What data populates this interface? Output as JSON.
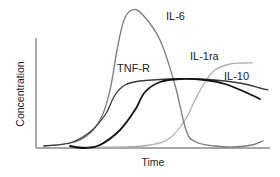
{
  "chart_data": {
    "type": "line",
    "title": "",
    "xlabel": "Time",
    "ylabel": "Concentration",
    "grid": false,
    "legend": "inline labels",
    "ticks": false,
    "series": [
      {
        "name": "IL-6",
        "color": "#7a7a7a",
        "width": 1.3,
        "label_pos": [
          166,
          20
        ],
        "points": [
          [
            44,
            146
          ],
          [
            80,
            140
          ],
          [
            100,
            120
          ],
          [
            110,
            90
          ],
          [
            117,
            50
          ],
          [
            124,
            20
          ],
          [
            132,
            10
          ],
          [
            142,
            14
          ],
          [
            160,
            40
          ],
          [
            175,
            85
          ],
          [
            186,
            130
          ],
          [
            196,
            142
          ],
          [
            215,
            146
          ],
          [
            235,
            147
          ],
          [
            252,
            145
          ],
          [
            263,
            141
          ]
        ]
      },
      {
        "name": "TNF-R",
        "color": "#3a3a3a",
        "width": 1.3,
        "label_pos": [
          117,
          72
        ],
        "points": [
          [
            44,
            146
          ],
          [
            70,
            143
          ],
          [
            90,
            132
          ],
          [
            105,
            115
          ],
          [
            115,
            95
          ],
          [
            125,
            85
          ],
          [
            140,
            81
          ],
          [
            170,
            79
          ],
          [
            200,
            79
          ],
          [
            225,
            81
          ],
          [
            245,
            84
          ],
          [
            260,
            88
          ],
          [
            268,
            90
          ]
        ]
      },
      {
        "name": "IL-10",
        "color": "#111111",
        "width": 1.8,
        "label_pos": [
          224,
          80
        ],
        "points": [
          [
            70,
            146
          ],
          [
            85,
            148
          ],
          [
            100,
            145
          ],
          [
            120,
            130
          ],
          [
            135,
            110
          ],
          [
            145,
            92
          ],
          [
            160,
            82
          ],
          [
            180,
            79
          ],
          [
            205,
            80
          ],
          [
            225,
            84
          ],
          [
            245,
            92
          ],
          [
            260,
            99
          ]
        ]
      },
      {
        "name": "IL-1ra",
        "color": "#b0b0b0",
        "width": 1.3,
        "label_pos": [
          190,
          60
        ],
        "points": [
          [
            80,
            147
          ],
          [
            120,
            147
          ],
          [
            150,
            145
          ],
          [
            170,
            138
          ],
          [
            185,
            120
          ],
          [
            195,
            100
          ],
          [
            205,
            82
          ],
          [
            215,
            70
          ],
          [
            230,
            64
          ],
          [
            245,
            63
          ],
          [
            252,
            63
          ]
        ]
      }
    ],
    "axes": {
      "origin": [
        36,
        148
      ],
      "x_end": 270,
      "y_top": 38
    }
  }
}
